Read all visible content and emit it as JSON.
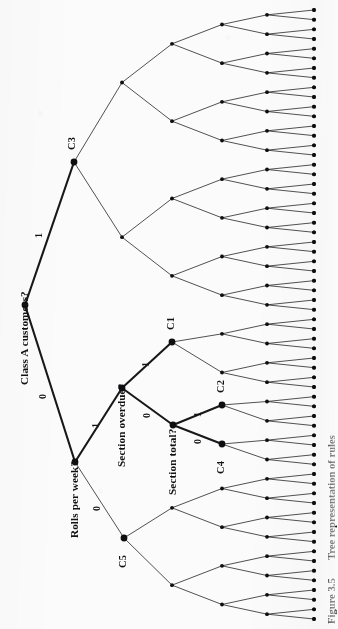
{
  "figure": {
    "caption_number": "Figure 3.5",
    "caption_text": "Tree representation of rules",
    "orientation": "rotated-90-ccw",
    "background_color": "#fbfbfb",
    "ink_color": "#18181a"
  },
  "decision_nodes": [
    {
      "id": "root",
      "label": "Class A customers?",
      "x": 25,
      "y": 305
    },
    {
      "id": "n1",
      "label": "Rolls per week?",
      "x": 75,
      "y": 462
    },
    {
      "id": "n2",
      "label": "Section overdue?",
      "x": 122,
      "y": 388
    },
    {
      "id": "n3",
      "label": "Section total?",
      "x": 173,
      "y": 425
    }
  ],
  "class_nodes": [
    {
      "id": "C3",
      "label": "C3",
      "x": 74,
      "y": 162
    },
    {
      "id": "C5",
      "label": "C5",
      "x": 124,
      "y": 538
    },
    {
      "id": "C1",
      "label": "C1",
      "x": 172,
      "y": 342
    },
    {
      "id": "C2",
      "label": "C2",
      "x": 222,
      "y": 405
    },
    {
      "id": "C4",
      "label": "C4",
      "x": 222,
      "y": 444
    }
  ],
  "edge_labels": [
    {
      "id": "e-root-c3",
      "label": "1",
      "x": 38,
      "y": 232
    },
    {
      "id": "e-root-n1",
      "label": "0",
      "x": 42,
      "y": 393
    },
    {
      "id": "e-n1-n2",
      "label": "1",
      "x": 95,
      "y": 422
    },
    {
      "id": "e-n1-c5",
      "label": "0",
      "x": 96,
      "y": 505
    },
    {
      "id": "e-n2-c1",
      "label": "1",
      "x": 145,
      "y": 361
    },
    {
      "id": "e-n2-n3",
      "label": "0",
      "x": 146,
      "y": 412
    },
    {
      "id": "e-n3-c2",
      "label": "1",
      "x": 197,
      "y": 411
    },
    {
      "id": "e-n3-c4",
      "label": "0",
      "x": 197,
      "y": 438
    }
  ],
  "levels": {
    "x": [
      25,
      75,
      122,
      172,
      222,
      267,
      314
    ]
  },
  "tree": {
    "depth": 6,
    "leaf_count": 64,
    "node_marker": "filled-circle",
    "highlighted_path_description": "root to C3, and root to Rolls per week? to Section overdue? to C1 / Section total? to C2 and C4"
  }
}
